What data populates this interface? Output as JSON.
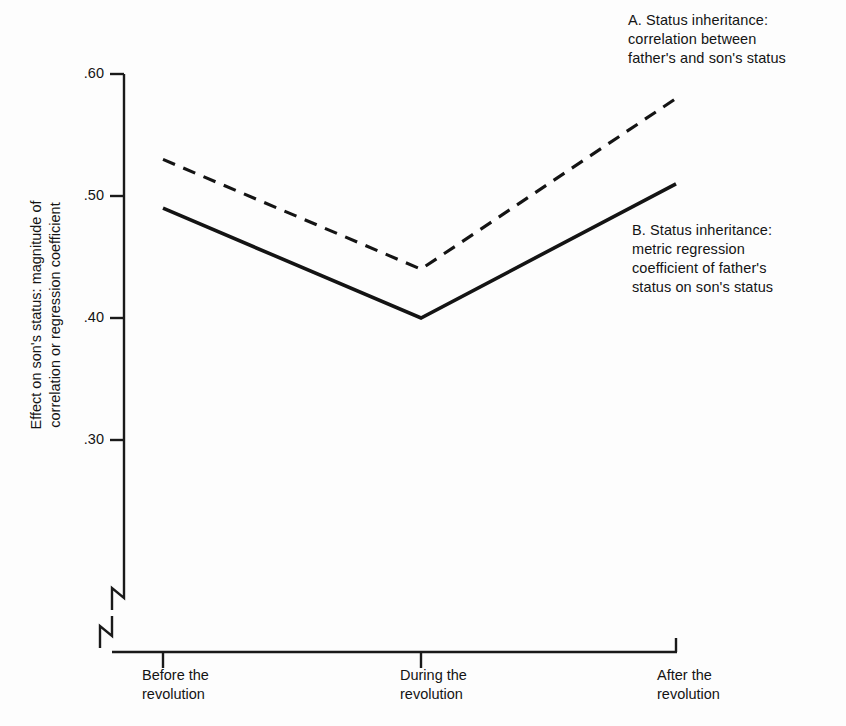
{
  "chart_data": {
    "type": "line",
    "title": "",
    "xlabel": "",
    "ylabel": "Effect on son's status: magnitude of\ncorrelation or regression coefficient",
    "categories": [
      "Before the\nrevolution",
      "During the\nrevolution",
      "After the\nrevolution"
    ],
    "category_labels_flat": [
      "Before the revolution",
      "During the revolution",
      "After the revolution"
    ],
    "yticks": [
      ".60",
      ".50",
      ".40",
      ".30"
    ],
    "ytick_values": [
      0.6,
      0.5,
      0.4,
      0.3
    ],
    "ylim": [
      0.3,
      0.6
    ],
    "y_axis_break": true,
    "x_axis_break": true,
    "grid": false,
    "legend_position": "inline-annotation",
    "series": [
      {
        "name": "A. Status inheritance:\ncorrelation between\nfather's and son's status",
        "short_name": "A",
        "style": "dashed",
        "color": "#141414",
        "values": [
          0.53,
          0.44,
          0.58
        ]
      },
      {
        "name": "B. Status inheritance:\nmetric regression\ncoefficient of father's\nstatus on son's status",
        "short_name": "B",
        "style": "solid",
        "color": "#141414",
        "values": [
          0.49,
          0.4,
          0.51
        ]
      }
    ],
    "annotations": [
      {
        "id": "A",
        "text": "A. Status inheritance:\ncorrelation between\nfather's and son's status"
      },
      {
        "id": "B",
        "text": "B. Status inheritance:\nmetric regression\ncoefficient of father's\nstatus on son's status"
      }
    ]
  },
  "colors": {
    "background": "#fdfdfd",
    "ink": "#141414",
    "axis": "#1a1a1a"
  }
}
